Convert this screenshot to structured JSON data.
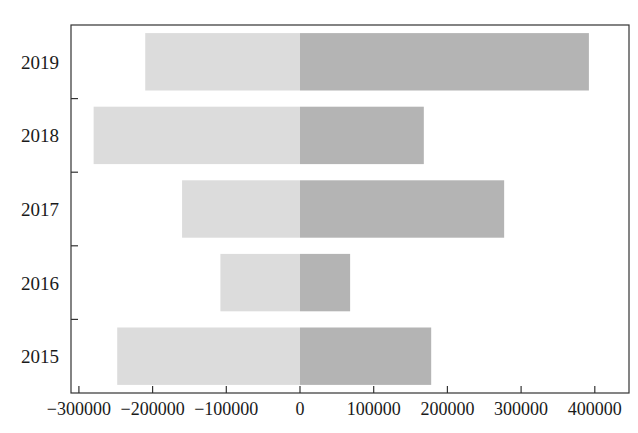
{
  "chart_data": {
    "type": "bar",
    "orientation": "horizontal",
    "stacked_diverging": true,
    "title": "",
    "xlabel": "",
    "ylabel": "",
    "categories": [
      "2015",
      "2016",
      "2017",
      "2018",
      "2019"
    ],
    "series": [
      {
        "name": "negative",
        "values": [
          -248000,
          -108000,
          -160000,
          -280000,
          -210000
        ],
        "color": "#dcdcdc"
      },
      {
        "name": "positive",
        "values": [
          178000,
          68000,
          277000,
          168000,
          392000
        ],
        "color": "#b4b4b4"
      }
    ],
    "xlim": [
      -310000,
      425000
    ],
    "xticks": [
      -300000,
      -200000,
      -100000,
      0,
      100000,
      200000,
      300000,
      400000
    ],
    "xtick_labels": [
      "−300000",
      "−200000",
      "−100000",
      "0",
      "100000",
      "200000",
      "300000",
      "400000"
    ],
    "grid": false,
    "legend": null
  }
}
